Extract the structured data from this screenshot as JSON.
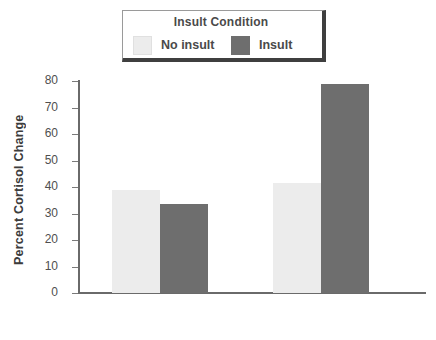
{
  "chart_data": {
    "type": "bar",
    "title": "",
    "xlabel": "",
    "ylabel": "Percent Cortisol Change",
    "ylim": [
      0,
      80
    ],
    "yticks": [
      0,
      10,
      20,
      30,
      40,
      50,
      60,
      70,
      80
    ],
    "grid": false,
    "legend_position": "top-center",
    "legend_title": "Insult Condition",
    "categories": [
      "Northerners",
      "Southerners"
    ],
    "series": [
      {
        "name": "No insult",
        "color": "#ececec",
        "values": [
          39,
          41.5
        ]
      },
      {
        "name": "Insult",
        "color": "#6e6e6e",
        "values": [
          33.5,
          79
        ]
      }
    ]
  },
  "axes": {
    "y_title": "Percent Cortisol Change",
    "tick_labels": [
      "80",
      "70",
      "60",
      "50",
      "40",
      "30",
      "20",
      "10",
      "0"
    ]
  },
  "legend": {
    "title": "Insult Condition",
    "entries": [
      {
        "label": "No insult",
        "color": "#ececec"
      },
      {
        "label": "Insult",
        "color": "#6e6e6e"
      }
    ]
  },
  "colors": {
    "no_insult": "#ececec",
    "insult": "#6e6e6e",
    "axis": "#6a6a6a",
    "text": "#4a4a4a",
    "legend_border": "#3f3f3f",
    "background": "#ffffff"
  }
}
